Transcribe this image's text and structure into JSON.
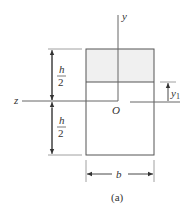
{
  "figure": {
    "caption": "(a)",
    "shaded_region_color": "#f0f0f0",
    "line_color": "#555555"
  },
  "labels": {
    "y_axis": "y",
    "z_axis": "z",
    "origin": "O",
    "width": "b",
    "height_top_num": "h",
    "height_top_den": "2",
    "height_bottom_num": "h",
    "height_bottom_den": "2",
    "y1_main": "y",
    "y1_sub": "1"
  }
}
